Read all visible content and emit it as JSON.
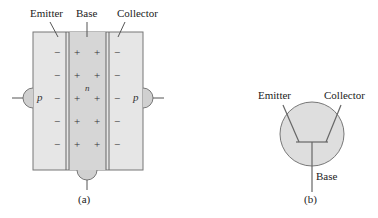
{
  "figure_a": {
    "labels": {
      "emitter": "Emitter",
      "base": "Base",
      "collector": "Collector"
    },
    "emitter_region": "p",
    "base_region": "n",
    "collector_region": "p",
    "emitter_charge": "−",
    "base_charge": "+",
    "collector_charge": "−",
    "caption": "(a)"
  },
  "figure_b": {
    "labels": {
      "emitter": "Emitter",
      "collector": "Collector",
      "base": "Base"
    },
    "caption": "(b)"
  },
  "colors": {
    "region_light": "#e3e3e3",
    "region_base": "#d5d5d5",
    "circle_fill": "#dedede",
    "line": "#666666"
  }
}
